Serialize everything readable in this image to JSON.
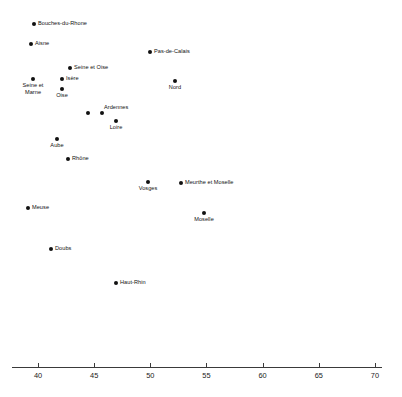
{
  "chart_data": {
    "type": "scatter",
    "title": "",
    "subtitle": "",
    "xlabel": "",
    "ylabel": "",
    "xlim": [
      37.7,
      70.0
    ],
    "ylim": [
      0,
      1
    ],
    "grid": false,
    "legend": null,
    "axis": {
      "orientation": "horizontal",
      "ticks": [
        40,
        45,
        50,
        55,
        60,
        65,
        70
      ],
      "tick_labels": [
        "40",
        "45",
        "50",
        "55",
        "60",
        "65",
        "70"
      ],
      "tick_min": 40,
      "tick_max": 70,
      "tick_step": 5
    },
    "marker": {
      "shape": "circle",
      "color": "#111111",
      "size": 4
    },
    "points": [
      {
        "label": "Bouches-du-Rhone",
        "x": 39.6,
        "px": 34,
        "py": 24,
        "label_pos": "right"
      },
      {
        "label": "Aisne",
        "x": 39.4,
        "px": 31,
        "py": 44,
        "label_pos": "right"
      },
      {
        "label": "Pas-de-Calais",
        "x": 50.0,
        "px": 150,
        "py": 52,
        "label_pos": "right"
      },
      {
        "label": "Seine et Oise",
        "x": 42.8,
        "px": 70,
        "py": 68,
        "label_pos": "right"
      },
      {
        "label": "Isère",
        "x": 42.1,
        "px": 62,
        "py": 79,
        "label_pos": "right"
      },
      {
        "label": "Seine et\nMarne",
        "x": 39.6,
        "px": 33,
        "py": 79,
        "label_pos": "below"
      },
      {
        "label": "Oise",
        "x": 42.1,
        "px": 62,
        "py": 89,
        "label_pos": "below"
      },
      {
        "label": "Nord",
        "x": 52.2,
        "px": 175,
        "py": 81,
        "label_pos": "below"
      },
      {
        "label": "Seine-Inférieure\n(or Seine-Maritime)",
        "x": 44.5,
        "px": 88,
        "py": 113,
        "label_pos": "left"
      },
      {
        "label": "Ardennes",
        "x": 45.7,
        "px": 102,
        "py": 113,
        "label_pos": "above-right"
      },
      {
        "label": "Loire",
        "x": 46.9,
        "px": 116,
        "py": 121,
        "label_pos": "below"
      },
      {
        "label": "Aube",
        "x": 41.7,
        "px": 57,
        "py": 139,
        "label_pos": "below"
      },
      {
        "label": "Rhône",
        "x": 42.7,
        "px": 68,
        "py": 159,
        "label_pos": "right"
      },
      {
        "label": "Vosges",
        "x": 49.8,
        "px": 148,
        "py": 182,
        "label_pos": "below"
      },
      {
        "label": "Meurthe et Moselle",
        "x": 52.7,
        "px": 181,
        "py": 183,
        "label_pos": "right"
      },
      {
        "label": "Meuse",
        "x": 39.1,
        "px": 28,
        "py": 208,
        "label_pos": "right"
      },
      {
        "label": "Moselle",
        "x": 54.8,
        "px": 204,
        "py": 213,
        "label_pos": "below"
      },
      {
        "label": "Doubs",
        "x": 41.2,
        "px": 51,
        "py": 249,
        "label_pos": "right"
      },
      {
        "label": "Haut-Rhin",
        "x": 46.9,
        "px": 116,
        "py": 283,
        "label_pos": "right"
      }
    ]
  },
  "geometry": {
    "axis_y": 367,
    "axis_x_start": 12,
    "axis_x_end": 382,
    "px_per_unit": 11.23,
    "x_at_40": 38
  },
  "colors": {
    "marker": "#111111",
    "axis": "#3a3a3a",
    "text": "#111111",
    "background": "#ffffff"
  }
}
